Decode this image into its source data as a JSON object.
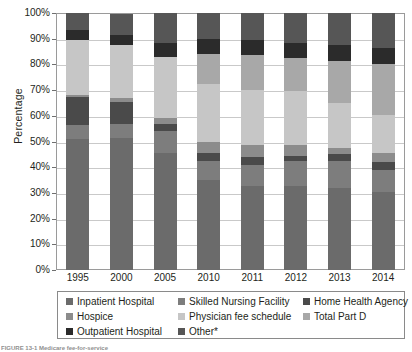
{
  "chart_data": {
    "type": "bar",
    "variant": "stacked-100-percent",
    "title": "",
    "xlabel": "",
    "ylabel": "Percentage",
    "ylim": [
      0,
      100
    ],
    "yticks": [
      "0%",
      "10%",
      "20%",
      "30%",
      "40%",
      "50%",
      "60%",
      "70%",
      "80%",
      "90%",
      "100%"
    ],
    "ytick_values": [
      0,
      10,
      20,
      30,
      40,
      50,
      60,
      70,
      80,
      90,
      100
    ],
    "grid": true,
    "legend_position": "bottom",
    "categories": [
      "1995",
      "2000",
      "2005",
      "2010",
      "2011",
      "2012",
      "2013",
      "2014"
    ],
    "series": [
      {
        "name": "Inpatient Hospital",
        "color": "#6b6b6b",
        "values": [
          51.0,
          51.5,
          45.5,
          35.0,
          32.5,
          32.5,
          32.0,
          30.5
        ]
      },
      {
        "name": "Skilled Nursing Facility",
        "color": "#7d7d7d",
        "values": [
          5.5,
          5.5,
          8.5,
          7.5,
          8.5,
          10.0,
          10.5,
          8.5
        ]
      },
      {
        "name": "Home Health Agency",
        "color": "#4a4a4a",
        "values": [
          11.0,
          8.5,
          3.0,
          3.0,
          3.0,
          2.0,
          2.5,
          3.0
        ]
      },
      {
        "name": "Hospice",
        "color": "#8c8c8c",
        "values": [
          0.5,
          1.5,
          2.0,
          4.5,
          4.5,
          4.0,
          2.5,
          3.5
        ]
      },
      {
        "name": "Physician fee schedule",
        "color": "#c6c6c6",
        "values": [
          21.5,
          20.5,
          24.0,
          22.5,
          21.5,
          21.0,
          17.5,
          15.0
        ]
      },
      {
        "name": "Total Part D",
        "color": "#a8a8a8",
        "values": [
          0.0,
          0.0,
          0.0,
          11.5,
          13.5,
          13.0,
          16.5,
          19.5
        ]
      },
      {
        "name": "Outpatient Hospital",
        "color": "#2b2b2b",
        "values": [
          4.0,
          4.0,
          5.5,
          6.0,
          6.0,
          6.0,
          6.0,
          6.5
        ]
      },
      {
        "name": "Other*",
        "color": "#565656",
        "values": [
          6.5,
          8.0,
          11.5,
          10.0,
          10.5,
          11.5,
          12.5,
          13.5
        ]
      }
    ]
  },
  "legend": {
    "items": [
      {
        "label": "Inpatient Hospital",
        "color": "#6b6b6b"
      },
      {
        "label": "Skilled Nursing Facility",
        "color": "#7d7d7d"
      },
      {
        "label": "Home Health Agency",
        "color": "#4a4a4a"
      },
      {
        "label": "Hospice",
        "color": "#8c8c8c"
      },
      {
        "label": "Physician fee schedule",
        "color": "#c6c6c6"
      },
      {
        "label": "Total Part D",
        "color": "#a8a8a8"
      },
      {
        "label": "Outpatient Hospital",
        "color": "#2b2b2b"
      },
      {
        "label": "Other*",
        "color": "#565656"
      }
    ]
  },
  "caption": {
    "text": "FIGURE 13-1  Medicare fee-for-service"
  }
}
